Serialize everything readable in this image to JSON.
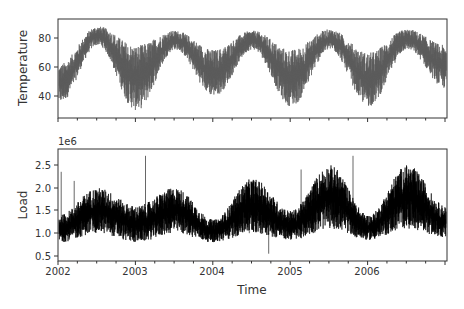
{
  "chart_data": [
    {
      "type": "line",
      "title": "",
      "xlabel": "",
      "ylabel": "Temperature",
      "x_range": [
        "2002-01-01",
        "2006-12-31"
      ],
      "ylim": [
        25,
        93
      ],
      "yticks": [
        40,
        60,
        80
      ],
      "xticks": [
        "2002",
        "2003",
        "2004",
        "2005",
        "2006"
      ],
      "show_xtick_labels": false,
      "grid": false,
      "color": "#555555",
      "series": [
        {
          "name": "Temperature",
          "description": "hourly temperature, seasonal cycle peaking each summer",
          "seasonal_summary": {
            "x": [
              "2002-Jan",
              "2002-Jul",
              "2003-Jan",
              "2003-Jul",
              "2004-Jan",
              "2004-Jul",
              "2005-Jan",
              "2005-Jul",
              "2006-Jan",
              "2006-Jul",
              "2006-Dec"
            ],
            "upper": [
              62,
              88,
              75,
              85,
              72,
              85,
              72,
              86,
              70,
              86,
              75
            ],
            "lower": [
              35,
              75,
              30,
              72,
              40,
              72,
              33,
              72,
              33,
              72,
              45
            ]
          }
        }
      ]
    },
    {
      "type": "line",
      "title": "",
      "xlabel": "Time",
      "ylabel": "Load",
      "y_offset_label": "1e6",
      "x_range": [
        "2002-01-01",
        "2006-12-31"
      ],
      "ylim": [
        0.39,
        2.85
      ],
      "yticks": [
        0.5,
        1.0,
        1.5,
        2.0,
        2.5
      ],
      "xticks": [
        "2002",
        "2003",
        "2004",
        "2005",
        "2006"
      ],
      "grid": false,
      "color": "#000000",
      "series": [
        {
          "name": "Load",
          "description": "hourly electric load (x1e6), summer peaks each year",
          "seasonal_summary": {
            "x": [
              "2002-Jan",
              "2002-Jul",
              "2003-Jan",
              "2003-Jul",
              "2004-Jan",
              "2004-Jul",
              "2005-Jan",
              "2005-Jul",
              "2006-Jan",
              "2006-Jul",
              "2006-Dec"
            ],
            "upper": [
              1.4,
              2.0,
              1.6,
              2.0,
              1.3,
              2.2,
              1.5,
              2.5,
              1.4,
              2.5,
              1.6
            ],
            "lower": [
              0.8,
              1.0,
              0.8,
              1.0,
              0.8,
              1.0,
              0.85,
              1.1,
              0.85,
              1.1,
              0.9
            ]
          },
          "spikes": [
            {
              "x": "2002-Jan",
              "value": 2.35
            },
            {
              "x": "2002-Mar",
              "value": 2.15
            },
            {
              "x": "2003-Feb",
              "value": 2.7
            },
            {
              "x": "2004-Jun",
              "value": 2.0
            },
            {
              "x": "2004-Sep",
              "value": 0.55
            },
            {
              "x": "2005-Feb",
              "value": 2.4
            },
            {
              "x": "2005-Oct",
              "value": 2.7
            }
          ]
        }
      ]
    }
  ],
  "labels": {
    "top_ylabel": "Temperature",
    "bottom_ylabel": "Load",
    "bottom_xlabel": "Time",
    "bottom_offset": "1e6",
    "top_yticks": [
      "80",
      "60",
      "40"
    ],
    "bottom_yticks": [
      "2.5",
      "2.0",
      "1.5",
      "1.0",
      "0.5"
    ],
    "xticks": [
      "2002",
      "2003",
      "2004",
      "2005",
      "2006"
    ]
  }
}
